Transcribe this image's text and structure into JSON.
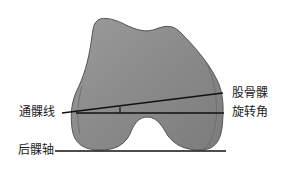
{
  "diagram": {
    "colors": {
      "bone_fill": "#8c8c8c",
      "bone_edge": "#555555",
      "line": "#111111",
      "background": "#ffffff"
    },
    "labels": {
      "transepicondylar_line": "通髁线",
      "rotation_angle_line1": "股骨髁",
      "rotation_angle_line2": "旋转角",
      "posterior_condylar_axis": "后髁轴"
    }
  }
}
